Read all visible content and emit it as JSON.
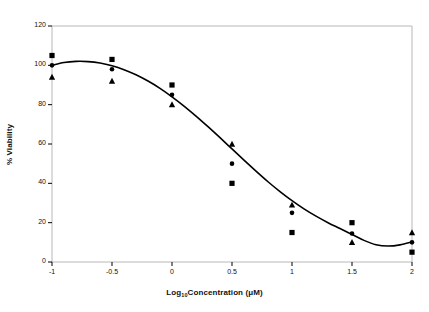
{
  "chart_data": {
    "type": "scatter",
    "title": "",
    "subtitle": "",
    "xlabel": "Log10Concentration (μM)",
    "xlabel_base": "Log",
    "xlabel_sub": "10",
    "xlabel_rest": "Concentration (μM)",
    "ylabel": "% Viability",
    "xlim": [
      -1,
      2
    ],
    "ylim": [
      0,
      120
    ],
    "xticks": [
      -1,
      -0.5,
      0,
      0.5,
      1,
      1.5,
      2
    ],
    "xticklabels": [
      "-1",
      "-0.5",
      "0",
      "0.5",
      "1",
      "1.5",
      "2"
    ],
    "yticks": [
      0,
      20,
      40,
      60,
      80,
      100,
      120
    ],
    "yticklabels": [
      "0",
      "20",
      "40",
      "60",
      "80",
      "100",
      "120"
    ],
    "grid": false,
    "legend": "none",
    "x": [
      -1,
      -0.5,
      0,
      0.5,
      1,
      1.5,
      2
    ],
    "series": [
      {
        "name": "square-series",
        "marker": "square",
        "color": "#000000",
        "values": [
          105,
          103,
          90,
          40,
          15,
          20,
          5
        ]
      },
      {
        "name": "circle-series",
        "marker": "circle",
        "color": "#000000",
        "values": [
          100,
          98,
          85,
          50,
          25,
          14.5,
          10
        ]
      },
      {
        "name": "triangle-series",
        "marker": "triangle",
        "color": "#000000",
        "values": [
          94,
          92,
          80,
          60,
          29,
          10,
          15
        ]
      }
    ],
    "fit_curve": {
      "name": "fitted-dose-response-curve",
      "color": "#000000",
      "points": [
        [
          -1.0,
          100.0
        ],
        [
          -0.9,
          101.4
        ],
        [
          -0.8,
          102.0
        ],
        [
          -0.7,
          101.9
        ],
        [
          -0.6,
          101.2
        ],
        [
          -0.5,
          99.8
        ],
        [
          -0.4,
          97.8
        ],
        [
          -0.3,
          95.2
        ],
        [
          -0.2,
          92.0
        ],
        [
          -0.1,
          88.3
        ],
        [
          0.0,
          84.0
        ],
        [
          0.1,
          79.3
        ],
        [
          0.2,
          74.2
        ],
        [
          0.3,
          68.8
        ],
        [
          0.4,
          63.2
        ],
        [
          0.5,
          57.5
        ],
        [
          0.6,
          51.8
        ],
        [
          0.7,
          46.2
        ],
        [
          0.8,
          40.8
        ],
        [
          0.9,
          35.8
        ],
        [
          1.0,
          31.2
        ],
        [
          1.1,
          27.0
        ],
        [
          1.2,
          23.3
        ],
        [
          1.3,
          20.0
        ],
        [
          1.4,
          17.0
        ],
        [
          1.5,
          14.0
        ],
        [
          1.6,
          11.0
        ],
        [
          1.7,
          8.8
        ],
        [
          1.8,
          8.1
        ],
        [
          1.9,
          8.7
        ],
        [
          2.0,
          10.2
        ]
      ]
    }
  },
  "axes": {
    "frame_color": "#b8b8b8",
    "tick_color": "#000000",
    "text_color": "#111111"
  }
}
